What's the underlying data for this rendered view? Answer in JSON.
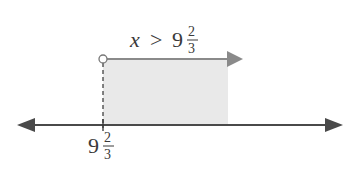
{
  "diagram": {
    "type": "number-line-inequality",
    "inequality": {
      "variable": "x",
      "operator": ">",
      "whole": "9",
      "numerator": "2",
      "denominator": "3"
    },
    "tick_label": {
      "whole": "9",
      "numerator": "2",
      "denominator": "3"
    },
    "endpoint": "open-circle",
    "direction": "right",
    "colors": {
      "axis": "#4a4a4a",
      "ray": "#8a8a8a",
      "shade": "#e9e9e9",
      "text": "#3a3a3a"
    }
  }
}
